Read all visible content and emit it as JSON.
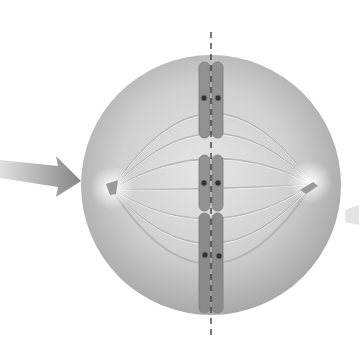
{
  "figure": {
    "elements": [
      "cell",
      "spindle-fibers",
      "centrosome-left",
      "centrosome-right",
      "chromosome-top",
      "chromosome-middle",
      "chromosome-bottom",
      "metaphase-plate-line",
      "pointer-arrow-left",
      "faint-arrow-right"
    ],
    "colors": {
      "background": "#ffffff",
      "cell": "#c8c8c8",
      "cell_edge": "#a8a8a8",
      "chromosome": "#8f8f8f",
      "arrow": "#8a8a8a",
      "line": "#333333"
    }
  }
}
